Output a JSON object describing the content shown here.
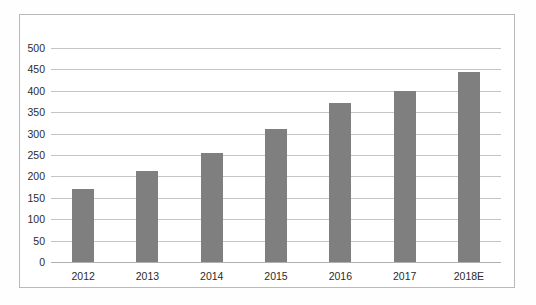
{
  "chart_data": {
    "type": "bar",
    "title": "",
    "subtitle": "",
    "xlabel": "",
    "ylabel": "",
    "categories": [
      "2012",
      "2013",
      "2014",
      "2015",
      "2016",
      "2017",
      "2018E"
    ],
    "values": [
      170,
      213,
      255,
      310,
      372,
      400,
      445
    ],
    "series": [
      {
        "name": "",
        "values": [
          170,
          213,
          255,
          310,
          372,
          400,
          445
        ]
      }
    ],
    "ylim": [
      0,
      500
    ],
    "ytick_labels": [
      "500",
      "450",
      "400",
      "350",
      "300",
      "250",
      "200",
      "150",
      "100",
      "50",
      "0"
    ],
    "ytick_values": [
      500,
      450,
      400,
      350,
      300,
      250,
      200,
      150,
      100,
      50,
      0
    ],
    "ytick_step": 50,
    "grid": true,
    "grid_axis": "y",
    "legend": false,
    "legend_position": "none",
    "annotations": [],
    "bar_color": "#7f7f7f",
    "grid_color": "#c4c4c4",
    "frame_color": "#b9b9b9",
    "background_color": "#ffffff",
    "text_color": "#2b2b2b"
  }
}
